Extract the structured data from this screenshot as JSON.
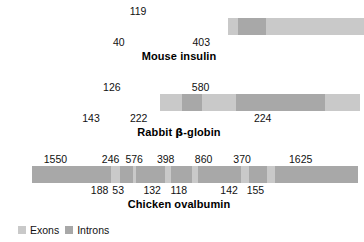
{
  "figure": {
    "legend": {
      "exon_label": "Exons",
      "intron_label": "Introns",
      "exon_color": "#c9c9c9",
      "intron_color": "#a8a8a8"
    }
  },
  "chart_data": {
    "type": "bar",
    "xlabel": "",
    "ylabel": "",
    "grid": false,
    "legend_position": "bottom-left",
    "series": [
      {
        "name": "Mouse insulin",
        "segments": [
          {
            "type": "exon",
            "length": 40,
            "label": "40",
            "label_side": "below"
          },
          {
            "type": "intron",
            "length": 119,
            "label": "119",
            "label_side": "above"
          },
          {
            "type": "exon",
            "length": 403,
            "label": "403",
            "label_side": "below"
          }
        ]
      },
      {
        "name": "Rabbit β-globin",
        "segments": [
          {
            "type": "exon",
            "length": 143,
            "label": "143",
            "label_side": "below"
          },
          {
            "type": "intron",
            "length": 126,
            "label": "126",
            "label_side": "above"
          },
          {
            "type": "exon",
            "length": 222,
            "label": "222",
            "label_side": "below"
          },
          {
            "type": "intron",
            "length": 580,
            "label": "580",
            "label_side": "above"
          },
          {
            "type": "exon",
            "length": 224,
            "label": "224",
            "label_side": "below"
          }
        ]
      },
      {
        "name": "Chicken ovalbumin",
        "segments": [
          {
            "type": "intron",
            "length": 1550,
            "label": "1550",
            "label_side": "above"
          },
          {
            "type": "exon",
            "length": 188,
            "label": "188",
            "label_side": "below"
          },
          {
            "type": "intron",
            "length": 246,
            "label": "246",
            "label_side": "above"
          },
          {
            "type": "exon",
            "length": 53,
            "label": "53",
            "label_side": "below"
          },
          {
            "type": "intron",
            "length": 576,
            "label": "576",
            "label_side": "above"
          },
          {
            "type": "exon",
            "length": 132,
            "label": "132",
            "label_side": "below"
          },
          {
            "type": "intron",
            "length": 398,
            "label": "398",
            "label_side": "above"
          },
          {
            "type": "exon",
            "length": 118,
            "label": "118",
            "label_side": "below"
          },
          {
            "type": "intron",
            "length": 860,
            "label": "860",
            "label_side": "above"
          },
          {
            "type": "exon",
            "length": 142,
            "label": "142",
            "label_side": "below"
          },
          {
            "type": "intron",
            "length": 370,
            "label": "370",
            "label_side": "above"
          },
          {
            "type": "exon",
            "length": 155,
            "label": "155",
            "label_side": "below"
          },
          {
            "type": "intron",
            "length": 1625,
            "label": "1625",
            "label_side": "above"
          }
        ]
      }
    ]
  },
  "rows": [
    {
      "title": "Mouse insulin",
      "title_html": "Mouse insulin",
      "top": 4,
      "bar_left": 114,
      "bar_width": 136,
      "bar_top": 22
    },
    {
      "title": "Rabbit β-globin",
      "title_html": "Rabbit <span class=\"greek\">β</span>-globin",
      "top": 80,
      "bar_left": 80,
      "bar_width": 200,
      "bar_top": 98
    },
    {
      "title": "Chicken ovalbumin",
      "title_html": "Chicken ovalbumin",
      "top": 152,
      "bar_left": 16,
      "bar_width": 326,
      "bar_top": 170
    }
  ]
}
